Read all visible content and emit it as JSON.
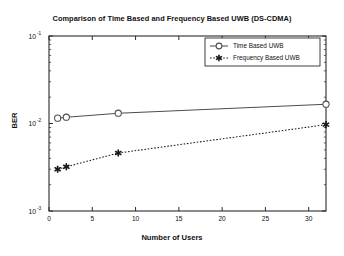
{
  "chart_data": {
    "type": "line",
    "title": "Comparison of Time Based and Frequency Based UWB (DS-CDMA)",
    "xlabel": "Number of Users",
    "ylabel": "BER",
    "xscale": "linear",
    "yscale": "log",
    "xlim": [
      0,
      32
    ],
    "ylim": [
      0.001,
      0.1
    ],
    "xticks": [
      0,
      5,
      10,
      15,
      20,
      25,
      30
    ],
    "xticklabels": [
      "0",
      "5",
      "10",
      "15",
      "20",
      "25",
      "30"
    ],
    "yticks": [
      0.001,
      0.01,
      0.1
    ],
    "yticklabels": [
      "10",
      "10",
      "10"
    ],
    "yticklabel_exponents": [
      "-3",
      "-2",
      "-1"
    ],
    "grid": false,
    "legend_position": "upper right",
    "series": [
      {
        "name": "Time Based UWB",
        "linestyle": "solid",
        "marker": "circle-open",
        "color": "#4d4d4d",
        "x": [
          1,
          2,
          8,
          32
        ],
        "y": [
          0.0115,
          0.0118,
          0.0131,
          0.0166
        ]
      },
      {
        "name": "Frequency Based UWB",
        "linestyle": "dotted",
        "marker": "star-filled",
        "color": "#1a1a1a",
        "x": [
          1,
          2,
          8,
          32
        ],
        "y": [
          0.003,
          0.0032,
          0.0046,
          0.0097
        ]
      }
    ]
  },
  "legend": {
    "entries": [
      {
        "label": "Time Based UWB"
      },
      {
        "label": "Frequency Based UWB"
      }
    ]
  }
}
